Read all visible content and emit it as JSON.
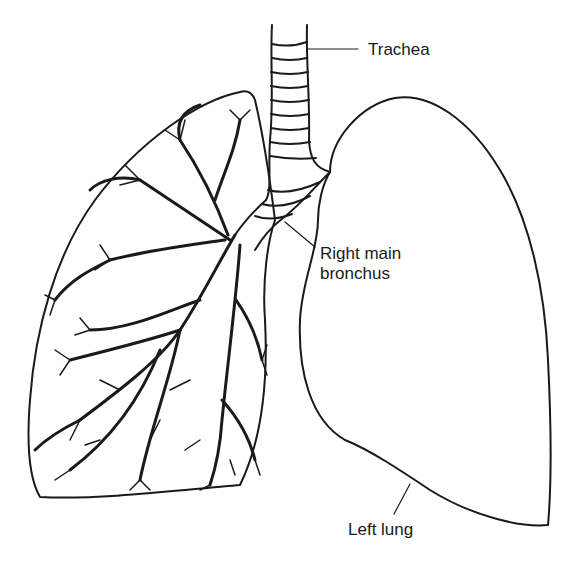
{
  "diagram": {
    "labels": {
      "trachea": "Trachea",
      "bronchus_line1": "Right main",
      "bronchus_line2": "bronchus",
      "left_lung": "Left lung"
    },
    "colors": {
      "ink": "#1a1a1a",
      "background": "#ffffff"
    }
  }
}
